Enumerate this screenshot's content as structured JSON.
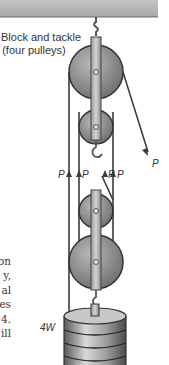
{
  "diagram": {
    "title_line1": "Block and tackle",
    "title_line2": "(four pulleys)",
    "force_label": "P",
    "weight_label": "4W",
    "tension_labels": [
      "P",
      "P",
      "P",
      "P"
    ],
    "pulley_count": 4,
    "colors": {
      "ceiling": "#b4b4b4",
      "pulley": "#8a8a8a",
      "rope": "#3a3a3a",
      "text": "#333333"
    }
  },
  "body_text_fragments": [
    "on",
    "y,",
    "al",
    "es",
    "4.",
    "ill"
  ]
}
